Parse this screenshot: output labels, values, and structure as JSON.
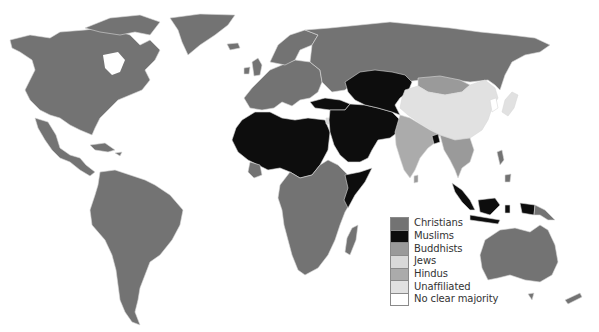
{
  "map": {
    "title": "",
    "categories": {
      "christians": {
        "label": "Christians",
        "color": "#737373"
      },
      "muslims": {
        "label": "Muslims",
        "color": "#0d0d0d"
      },
      "buddhists": {
        "label": "Buddhists",
        "color": "#9a9a9a"
      },
      "jews": {
        "label": "Jews",
        "color": "#d9d9d9"
      },
      "hindus": {
        "label": "Hindus",
        "color": "#ababab"
      },
      "unaffiliated": {
        "label": "Unaffiliated",
        "color": "#e1e1e1"
      },
      "none": {
        "label": "No clear majority",
        "color": "#ffffff"
      }
    },
    "regions": [
      {
        "name": "north-america",
        "category": "christians"
      },
      {
        "name": "greenland",
        "category": "christians"
      },
      {
        "name": "central-america",
        "category": "christians"
      },
      {
        "name": "caribbean",
        "category": "christians"
      },
      {
        "name": "south-america",
        "category": "christians"
      },
      {
        "name": "europe",
        "category": "christians"
      },
      {
        "name": "scandinavia",
        "category": "christians"
      },
      {
        "name": "british-isles",
        "category": "christians"
      },
      {
        "name": "iceland",
        "category": "christians"
      },
      {
        "name": "russia",
        "category": "christians"
      },
      {
        "name": "north-africa",
        "category": "muslims"
      },
      {
        "name": "west-africa-coast",
        "category": "christians"
      },
      {
        "name": "central-southern-africa",
        "category": "christians"
      },
      {
        "name": "horn-of-africa-somalia",
        "category": "muslims"
      },
      {
        "name": "madagascar",
        "category": "christians"
      },
      {
        "name": "turkey",
        "category": "muslims"
      },
      {
        "name": "middle-east",
        "category": "muslims"
      },
      {
        "name": "arabian-peninsula",
        "category": "muslims"
      },
      {
        "name": "central-asia",
        "category": "muslims"
      },
      {
        "name": "mongolia",
        "category": "buddhists"
      },
      {
        "name": "china",
        "category": "unaffiliated"
      },
      {
        "name": "japan",
        "category": "unaffiliated"
      },
      {
        "name": "korea",
        "category": "none"
      },
      {
        "name": "india",
        "category": "hindus"
      },
      {
        "name": "bangladesh",
        "category": "muslims"
      },
      {
        "name": "southeast-asia-mainland",
        "category": "buddhists"
      },
      {
        "name": "philippines",
        "category": "christians"
      },
      {
        "name": "indonesia",
        "category": "muslims"
      },
      {
        "name": "papua-new-guinea",
        "category": "christians"
      },
      {
        "name": "australia",
        "category": "christians"
      },
      {
        "name": "new-zealand",
        "category": "christians"
      },
      {
        "name": "israel",
        "category": "jews"
      },
      {
        "name": "sri-lanka",
        "category": "buddhists"
      }
    ]
  },
  "legend": {
    "items": [
      {
        "key": "christians",
        "label": "Christians",
        "color": "#737373"
      },
      {
        "key": "muslims",
        "label": "Muslims",
        "color": "#0d0d0d"
      },
      {
        "key": "buddhists",
        "label": "Buddhists",
        "color": "#9a9a9a"
      },
      {
        "key": "jews",
        "label": "Jews",
        "color": "#d9d9d9"
      },
      {
        "key": "hindus",
        "label": "Hindus",
        "color": "#ababab"
      },
      {
        "key": "unaffiliated",
        "label": "Unaffiliated",
        "color": "#e1e1e1"
      },
      {
        "key": "none",
        "label": "No clear majority",
        "color": "#ffffff"
      }
    ]
  }
}
